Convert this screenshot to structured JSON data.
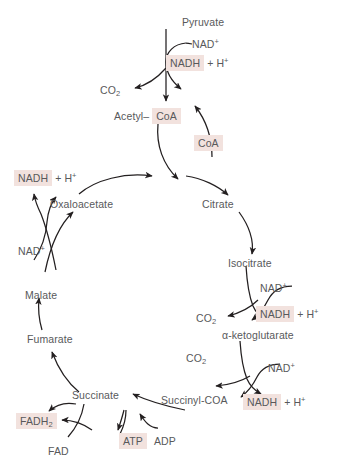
{
  "diagram": {
    "colors": {
      "highlight_bg": "#f2e2de",
      "text": "#58595b",
      "stroke": "#231f20",
      "background": "#ffffff"
    }
  },
  "nodes": {
    "pyruvate": "Pyruvate",
    "acetyl_prefix": "Acetyl–",
    "acetyl_coa": "CoA",
    "coa_released": "CoA",
    "oxaloacetate": "Oxaloacetate",
    "citrate": "Citrate",
    "isocitrate": "Isocitrate",
    "alpha_ketoglutarate": "α-ketoglutarate",
    "succinyl_coa": "Succinyl-COA",
    "succinate": "Succinate",
    "fumarate": "Fumarate",
    "malate": "Malate"
  },
  "cofactors": {
    "nad_pyruvate": "NAD",
    "nad_pyruvate_sup": "+",
    "nadh_pyruvate": "NADH",
    "nadh_pyruvate_tail": "+ H",
    "nadh_pyruvate_tail_sup": "+",
    "co2_pyruvate": "CO",
    "co2_pyruvate_sub": "2",
    "nad_malate": "NAD",
    "nad_malate_sup": "+",
    "nadh_malate": "NADH",
    "nadh_malate_tail": "+ H",
    "nadh_malate_tail_sup": "+",
    "nad_isocitrate": "NAD",
    "nad_isocitrate_sup": "+",
    "nadh_isocitrate": "NADH",
    "nadh_isocitrate_tail": "+ H",
    "nadh_isocitrate_tail_sup": "+",
    "co2_isocitrate": "CO",
    "co2_isocitrate_sub": "2",
    "nad_akg": "NAD",
    "nad_akg_sup": "+",
    "nadh_akg": "NADH",
    "nadh_akg_tail": "+ H",
    "nadh_akg_tail_sup": "+",
    "co2_akg": "CO",
    "co2_akg_sub": "2",
    "atp": "ATP",
    "adp": "ADP",
    "fadh2": "FADH",
    "fadh2_sub": "2",
    "fad": "FAD"
  }
}
